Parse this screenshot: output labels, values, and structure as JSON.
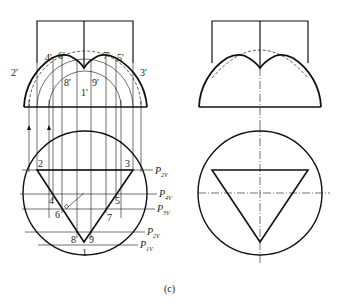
{
  "figure": {
    "caption": "(c)",
    "left_view": {
      "front_labels": [
        "2'",
        "4'",
        "6'",
        "8'",
        "1'",
        "9'",
        "7'",
        "5'",
        "3'"
      ],
      "top_labels": [
        "2",
        "3",
        "4",
        "5",
        "6",
        "7",
        "8",
        "9",
        "1"
      ],
      "plane_labels": [
        {
          "main": "P",
          "sub": "2V"
        },
        {
          "main": "P",
          "sub": "4V"
        },
        {
          "main": "P",
          "sub": "3V"
        },
        {
          "main": "P",
          "sub": "2V"
        },
        {
          "main": "P",
          "sub": "1V"
        }
      ]
    },
    "right_view": {
      "description": "Hemisphere with triangular prism cut; plan view circle with inverted triangle"
    }
  }
}
